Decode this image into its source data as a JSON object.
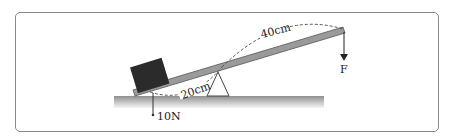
{
  "diagram": {
    "labels": {
      "weight": "10N",
      "short_arm": "20cm",
      "long_arm": "40cm",
      "force": "F"
    },
    "colors": {
      "frame": "#8a8a8a",
      "box": "#2b2b2b",
      "lever": "#9a9a9a",
      "ground": "#a8a8a8"
    }
  }
}
